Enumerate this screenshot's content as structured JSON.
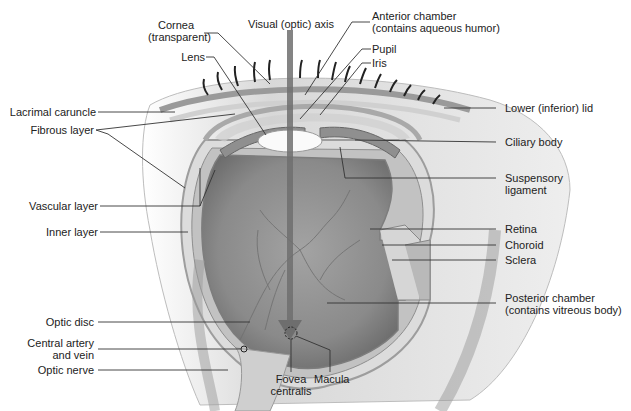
{
  "diagram": {
    "labels": {
      "cornea_line1": "Cornea",
      "cornea_line2": "(transparent)",
      "visual_axis": "Visual (optic) axis",
      "anterior_chamber_line1": "Anterior chamber",
      "anterior_chamber_line2": "(contains aqueous humor)",
      "pupil": "Pupil",
      "iris": "Iris",
      "lens": "Lens",
      "lacrimal_caruncle": "Lacrimal caruncle",
      "fibrous_layer": "Fibrous layer",
      "lower_lid": "Lower (inferior) lid",
      "ciliary_body": "Ciliary body",
      "suspensory_line1": "Suspensory",
      "suspensory_line2": "ligament",
      "vascular_layer": "Vascular layer",
      "inner_layer": "Inner layer",
      "retina": "Retina",
      "choroid": "Choroid",
      "sclera": "Sclera",
      "posterior_chamber_line1": "Posterior chamber",
      "posterior_chamber_line2": "(contains vitreous body)",
      "optic_disc": "Optic disc",
      "central_artery_line1": "Central artery",
      "central_artery_line2": "and vein",
      "optic_nerve": "Optic nerve",
      "fovea_line1": "Fovea",
      "fovea_line2": "centralis",
      "macula": "Macula"
    },
    "colors": {
      "leader_line": "#333333",
      "label_text": "#222222",
      "vitreous": "#8a8a8a",
      "axis_arrow": "#6e6e6e",
      "tissue_light": "#e6e6e6",
      "tissue_mid": "#c4c4c4"
    }
  }
}
